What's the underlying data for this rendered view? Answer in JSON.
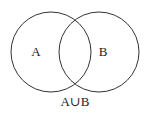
{
  "diagram": {
    "type": "venn",
    "sets": [
      {
        "label": "A",
        "cx": 51,
        "cy": 52,
        "r": 40
      },
      {
        "label": "B",
        "cx": 99,
        "cy": 52,
        "r": 40
      }
    ],
    "caption": "A∪B",
    "colors": {
      "stroke": "#333333",
      "fill": "none",
      "text": "#222222",
      "background": "#ffffff"
    }
  }
}
